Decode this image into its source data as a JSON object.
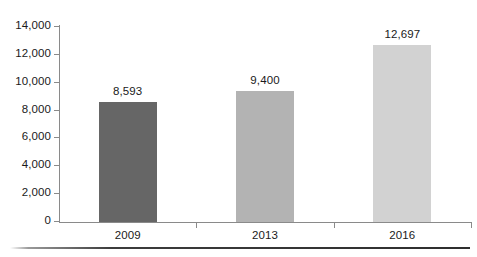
{
  "chart_data": {
    "type": "bar",
    "title": "",
    "subtitle": "",
    "xlabel": "",
    "ylabel": "",
    "categories": [
      "2009",
      "2013",
      "2016"
    ],
    "values": [
      8593,
      9400,
      12697
    ],
    "value_labels": [
      "8,593",
      "9,400",
      "12,697"
    ],
    "ylim": [
      0,
      14000
    ],
    "y_ticks": [
      0,
      2000,
      4000,
      6000,
      8000,
      10000,
      12000,
      14000
    ],
    "y_tick_labels": [
      "0",
      "2,000",
      "4,000",
      "6,000",
      "8,000",
      "10,000",
      "12,000",
      "14,000"
    ],
    "grid": false,
    "legend": false,
    "legend_position": "none",
    "series": [
      {
        "name": "",
        "values": [
          8593,
          9400,
          12697
        ]
      }
    ],
    "bar_colors": [
      "#666666",
      "#b3b3b3",
      "#d2d2d2"
    ],
    "axis_color": "#8a8a8a",
    "text_color": "#1a1a1a",
    "background_color": "#ffffff",
    "rule_color": "#2e2e2e"
  }
}
